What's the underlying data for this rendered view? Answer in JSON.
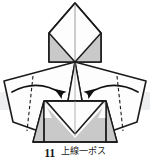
{
  "figure": {
    "kind": "origami-instruction",
    "background_color": "#ffffff",
    "line_color": "#1a1a1a",
    "shade_color": "#c9c9c9",
    "shade_color_dark": "#b8b8b8",
    "paper_white": "#fdfdfd",
    "band_color": "#e8ebee"
  },
  "caption": {
    "step_number": "11",
    "text": "上線一ポス"
  },
  "parts": {
    "top_flap_label": "top diamond flap",
    "left_wing_label": "left wing flap",
    "right_wing_label": "right wing flap",
    "body_label": "lower body panel",
    "center_point_label": "center convergence point"
  },
  "annotations": {
    "left_arrow_label": "fold left wing inward",
    "right_arrow_label": "fold right wing inward",
    "left_dashed_label": "left valley fold line",
    "right_dashed_label": "right valley fold line",
    "center_line_label": "vertical center crease"
  }
}
